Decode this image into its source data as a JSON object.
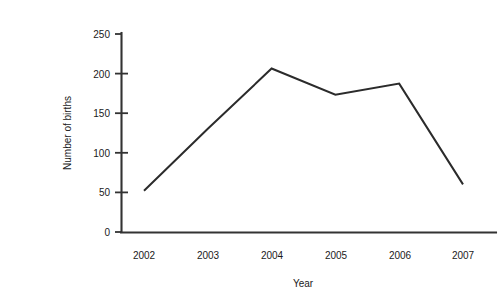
{
  "chart_data": {
    "type": "line",
    "title": "",
    "xlabel": "Year",
    "ylabel": "Number of births",
    "categories": [
      "2002",
      "2003",
      "2004",
      "2005",
      "2006",
      "2007"
    ],
    "x": [
      2002,
      2003,
      2004,
      2005,
      2006,
      2007
    ],
    "values": [
      52,
      130,
      206,
      173,
      187,
      60
    ],
    "series": [
      {
        "name": "Number of births",
        "values": [
          52,
          130,
          206,
          173,
          187,
          60
        ]
      }
    ],
    "ylim": [
      0,
      250
    ],
    "yticks": [
      0,
      50,
      100,
      150,
      200,
      250
    ],
    "ytick_labels": [
      "0",
      "50",
      "100",
      "150",
      "200",
      "250"
    ],
    "xtick_labels": [
      "2002",
      "2003",
      "2004",
      "2005",
      "2006",
      "2007"
    ],
    "grid": false,
    "legend": false,
    "legend_position": "none",
    "line_color": "#2b2b2b",
    "axis_color": "#333333",
    "background_color": "#ffffff",
    "markers": false
  },
  "axes": {
    "y_title": "Number of births",
    "x_title": "Year",
    "y_tick_0": "0",
    "y_tick_1": "50",
    "y_tick_2": "100",
    "y_tick_3": "150",
    "y_tick_4": "200",
    "y_tick_5": "250",
    "x_tick_0": "2002",
    "x_tick_1": "2003",
    "x_tick_2": "2004",
    "x_tick_3": "2005",
    "x_tick_4": "2006",
    "x_tick_5": "2007"
  }
}
